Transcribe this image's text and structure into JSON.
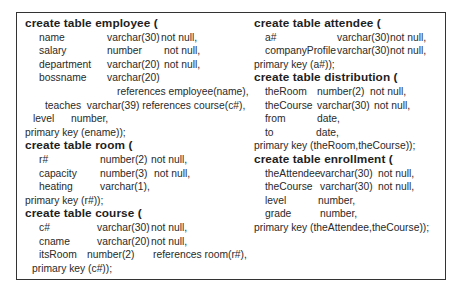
{
  "left": {
    "employee": {
      "header": "create table employee (",
      "rows": [
        {
          "name": "name",
          "type": "varchar(30)",
          "constraint": "not null,"
        },
        {
          "name": "salary",
          "type": "number",
          "constraint": "not null,"
        },
        {
          "name": "department",
          "type": "varchar(20)",
          "constraint": "not null,"
        },
        {
          "name": "bossname",
          "type": "varchar(20)",
          "constraint": ""
        }
      ],
      "references": "references employee(name),",
      "teaches": "teaches  varchar(39) references course(c#),",
      "level": {
        "name": "level",
        "type": "number,"
      },
      "pk": "primary key (ename));"
    },
    "room": {
      "header": "create table room (",
      "rows": [
        {
          "name": "r#",
          "type": "number(2)",
          "constraint": "not null,"
        },
        {
          "name": "capacity",
          "type": "number(3)",
          "constraint": "not null,"
        },
        {
          "name": "heating",
          "type": "varchar(1),",
          "constraint": ""
        }
      ],
      "pk": "primary key (r#));"
    },
    "course": {
      "header": "create table course (",
      "rows": [
        {
          "name": "c#",
          "type": "varchar(30)",
          "constraint": "not null,"
        },
        {
          "name": "cname",
          "type": "varchar(20)",
          "constraint": "not null,"
        },
        {
          "name": "itsRoom",
          "type": "number(2)",
          "constraint": "references room(r#),"
        }
      ],
      "pk": "primary key (c#));"
    }
  },
  "right": {
    "attendee": {
      "header": "create table attendee (",
      "rows": [
        {
          "name": "a#",
          "type": "varchar(30)",
          "constraint": "not null,"
        },
        {
          "name": "companyProfile",
          "type": "varchar(30)",
          "constraint": "not null,"
        }
      ],
      "pk": "primary key (a#));"
    },
    "distribution": {
      "header": "create table distribution (",
      "rows": [
        {
          "name": "theRoom",
          "type": "number(2)",
          "constraint": "not null,"
        },
        {
          "name": "theCourse",
          "type": "varchar(30)",
          "constraint": "not null,"
        },
        {
          "name": "from",
          "type": "date,",
          "constraint": ""
        },
        {
          "name": "to",
          "type": "date,",
          "constraint": ""
        }
      ],
      "pk": "primary key (theRoom,theCourse));"
    },
    "enrollment": {
      "header": "create table enrollment (",
      "rows": [
        {
          "name": "theAttendee",
          "type": "varchar(30)",
          "constraint": "not null,"
        },
        {
          "name": "theCourse",
          "type": "varchar(30)",
          "constraint": "not null,"
        },
        {
          "name": "level",
          "type": "number,",
          "constraint": ""
        },
        {
          "name": "grade",
          "type": "number,",
          "constraint": ""
        }
      ],
      "pk": "primary key (theAttendee,theCourse));"
    }
  }
}
